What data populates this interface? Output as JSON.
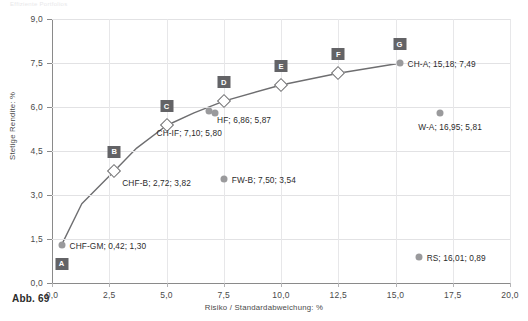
{
  "figure": {
    "caption": "Abb. 69",
    "top_strip": "Effiziente Portfolios"
  },
  "colors": {
    "asset_marker": "#9a9a9c",
    "frontier_line": "#6e6e70",
    "badge_bg": "#636366",
    "grid": "#e2e2e4",
    "axis": "#8a8a8a",
    "text": "#2b2b2b"
  },
  "chart_data": {
    "type": "scatter",
    "title": "",
    "xlabel": "Risiko / Standardabweichung: %",
    "ylabel": "Stetige Rendite: %",
    "xlim": [
      0.0,
      20.0
    ],
    "ylim": [
      0.0,
      9.0
    ],
    "xticks": [
      "0,0",
      "2,5",
      "5,0",
      "7,5",
      "10,0",
      "12,5",
      "15,0",
      "17,5",
      "20,0"
    ],
    "xtick_values": [
      0.0,
      2.5,
      5.0,
      7.5,
      10.0,
      12.5,
      15.0,
      17.5,
      20.0
    ],
    "yticks": [
      "0,0",
      "1,5",
      "3,0",
      "4,5",
      "6,0",
      "7,5",
      "9,0"
    ],
    "ytick_values": [
      0.0,
      1.5,
      3.0,
      4.5,
      6.0,
      7.5,
      9.0
    ],
    "grid": true,
    "legend": "none",
    "series": [
      {
        "name": "Effizienzkurve",
        "type": "line",
        "points": [
          {
            "x": 0.42,
            "y": 1.3
          },
          {
            "x": 1.3,
            "y": 2.7
          },
          {
            "x": 2.72,
            "y": 3.82
          },
          {
            "x": 3.7,
            "y": 4.6
          },
          {
            "x": 5.0,
            "y": 5.37
          },
          {
            "x": 6.2,
            "y": 5.8
          },
          {
            "x": 7.5,
            "y": 6.2
          },
          {
            "x": 10.0,
            "y": 6.75
          },
          {
            "x": 12.5,
            "y": 7.15
          },
          {
            "x": 15.18,
            "y": 7.49
          }
        ]
      },
      {
        "name": "Portfoliopunkte",
        "type": "markers",
        "points": [
          {
            "label": "A",
            "marker": "circle",
            "x": 0.42,
            "y": 1.3
          },
          {
            "label": "B",
            "marker": "diamond",
            "x": 2.72,
            "y": 3.82
          },
          {
            "label": "C",
            "marker": "diamond",
            "x": 5.0,
            "y": 5.37
          },
          {
            "label": "D",
            "marker": "diamond",
            "x": 7.5,
            "y": 6.2
          },
          {
            "label": "E",
            "marker": "diamond",
            "x": 10.0,
            "y": 6.75
          },
          {
            "label": "F",
            "marker": "diamond",
            "x": 12.5,
            "y": 7.15
          },
          {
            "label": "G",
            "marker": "circle",
            "x": 15.18,
            "y": 7.49
          }
        ]
      },
      {
        "name": "Anlageklassen",
        "type": "markers",
        "points": [
          {
            "label": "CHF-GM",
            "x": 0.42,
            "y": 1.3
          },
          {
            "label": "CHF-B",
            "x": 2.72,
            "y": 3.82
          },
          {
            "label": "HF",
            "x": 6.86,
            "y": 5.87
          },
          {
            "label": "CH-IF",
            "x": 7.1,
            "y": 5.8
          },
          {
            "label": "FW-B",
            "x": 7.5,
            "y": 3.54
          },
          {
            "label": "CH-A",
            "x": 15.18,
            "y": 7.49
          },
          {
            "label": "W-A",
            "x": 16.95,
            "y": 5.81
          },
          {
            "label": "RS",
            "x": 16.01,
            "y": 0.89
          }
        ]
      }
    ],
    "annotations": [
      {
        "text": "CHF-GM; 0,42; 1,30",
        "x": 0.42,
        "y": 1.3
      },
      {
        "text": "CHF-B; 2,72; 3,82",
        "x": 2.72,
        "y": 3.82
      },
      {
        "text": "HF; 6,86; 5,87",
        "x": 6.86,
        "y": 5.87
      },
      {
        "text": "CH-IF; 7,10; 5,80",
        "x": 7.1,
        "y": 5.8
      },
      {
        "text": "FW-B; 7,50; 3,54",
        "x": 7.5,
        "y": 3.54
      },
      {
        "text": "CH-A; 15,18; 7,49",
        "x": 15.18,
        "y": 7.49
      },
      {
        "text": "W-A; 16,95; 5,81",
        "x": 16.95,
        "y": 5.81
      },
      {
        "text": "RS; 16,01; 0,89",
        "x": 16.01,
        "y": 0.89
      }
    ]
  }
}
